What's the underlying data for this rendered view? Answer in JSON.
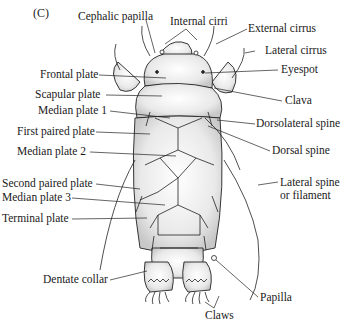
{
  "figure": {
    "panel_label": "(C)",
    "labels": {
      "cephalic_papilla": "Cephalic papilla",
      "internal_cirri": "Internal cirri",
      "external_cirrus": "External cirrus",
      "lateral_cirrus": "Lateral cirrus",
      "eyespot": "Eyespot",
      "frontal_plate": "Frontal plate",
      "scapular_plate": "Scapular plate",
      "clava": "Clava",
      "median_plate_1": "Median plate 1",
      "dorsolateral_spine": "Dorsolateral spine",
      "first_paired_plate": "First paired plate",
      "dorsal_spine": "Dorsal spine",
      "median_plate_2": "Median plate 2",
      "second_paired_plate": "Second paired plate",
      "lateral_spine_line1": "Lateral spine",
      "lateral_spine_line2": "or filament",
      "median_plate_3": "Median plate 3",
      "terminal_plate": "Terminal plate",
      "dentate_collar": "Dentate collar",
      "papilla": "Papilla",
      "claws": "Claws"
    }
  }
}
